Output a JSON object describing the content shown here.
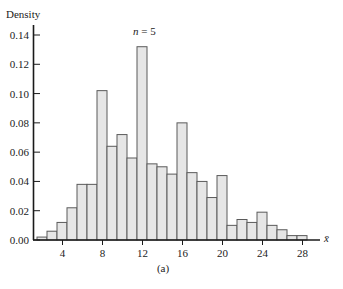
{
  "chart_data": {
    "type": "bar",
    "title": "",
    "annotation": "n = 5",
    "annotation_parts": {
      "var": "n",
      "rest": " = 5"
    },
    "xlabel": "x̄",
    "ylabel": "Density",
    "caption": "(a)",
    "xlim": [
      1.5,
      30.5
    ],
    "ylim": [
      0,
      0.14
    ],
    "xticks": [
      4,
      8,
      12,
      16,
      20,
      24,
      28
    ],
    "yticks": [
      0.0,
      0.02,
      0.04,
      0.06,
      0.08,
      0.1,
      0.12,
      0.14
    ],
    "ytick_labels": [
      "0.00",
      "0.02",
      "0.04",
      "0.06",
      "0.08",
      "0.10",
      "0.12",
      "0.14"
    ],
    "grid": false,
    "bin_width": 1,
    "categories": [
      2,
      3,
      4,
      5,
      6,
      7,
      8,
      9,
      10,
      11,
      12,
      13,
      14,
      15,
      16,
      17,
      18,
      19,
      20,
      21,
      22,
      23,
      24,
      25,
      26,
      27,
      28
    ],
    "values": [
      0.002,
      0.006,
      0.012,
      0.022,
      0.038,
      0.038,
      0.102,
      0.064,
      0.072,
      0.056,
      0.132,
      0.052,
      0.05,
      0.045,
      0.08,
      0.046,
      0.04,
      0.029,
      0.044,
      0.01,
      0.014,
      0.012,
      0.019,
      0.01,
      0.007,
      0.003,
      0.003
    ],
    "bar_fill": "#e6e6e6",
    "bar_stroke": "#5a5a5a"
  }
}
